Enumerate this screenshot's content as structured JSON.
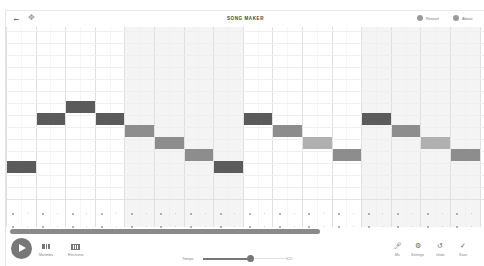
{
  "header": {
    "title": "SONG MAKER",
    "back_icon": "arrow-left-icon",
    "move_icon": "move-arrows-icon",
    "restart_label": "Restart",
    "about_label": "About"
  },
  "grid": {
    "bars": 4,
    "beats_per_bar": 4,
    "melody_rows": 14,
    "shaded_bars": [
      1,
      3
    ],
    "colors": {
      "dark": "#5b5b5b",
      "mid": "#8d8d8d",
      "light": "#b0b0b0",
      "grid_line": "#ececec",
      "shade": "#f4f4f4"
    },
    "notes": [
      {
        "col": 0,
        "row": 12,
        "shade": "dark"
      },
      {
        "col": 1,
        "row": 8,
        "shade": "dark"
      },
      {
        "col": 2,
        "row": 7,
        "shade": "dark"
      },
      {
        "col": 3,
        "row": 8,
        "shade": "dark"
      },
      {
        "col": 4,
        "row": 9,
        "shade": "mid"
      },
      {
        "col": 5,
        "row": 10,
        "shade": "mid"
      },
      {
        "col": 6,
        "row": 11,
        "shade": "mid"
      },
      {
        "col": 7,
        "row": 12,
        "shade": "dark"
      },
      {
        "col": 8,
        "row": 8,
        "shade": "dark"
      },
      {
        "col": 9,
        "row": 9,
        "shade": "mid"
      },
      {
        "col": 10,
        "row": 10,
        "shade": "light"
      },
      {
        "col": 11,
        "row": 11,
        "shade": "mid"
      },
      {
        "col": 12,
        "row": 8,
        "shade": "dark"
      },
      {
        "col": 13,
        "row": 9,
        "shade": "mid"
      },
      {
        "col": 14,
        "row": 10,
        "shade": "light"
      },
      {
        "col": 15,
        "row": 11,
        "shade": "mid"
      }
    ]
  },
  "footer": {
    "play_icon": "play-icon",
    "instrument_label": "Marimba",
    "percussion_label": "Electronic",
    "tempo_label": "Tempo",
    "tempo_value": "120",
    "tempo_percent": 55,
    "mic_label": "Mic",
    "settings_label": "Settings",
    "undo_label": "Undo",
    "save_label": "Save"
  }
}
